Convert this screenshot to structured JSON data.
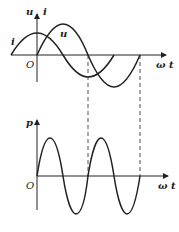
{
  "upper_plot": {
    "y_axis_labels": [
      "u",
      "i"
    ],
    "curve_labels": {
      "i": "i",
      "u": "u"
    },
    "origin_label": "O",
    "x_axis_label": "ω t"
  },
  "lower_plot": {
    "y_axis_label": "p",
    "origin_label": "O",
    "x_axis_label": "ω t"
  }
}
